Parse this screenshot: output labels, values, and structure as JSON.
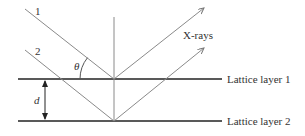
{
  "diagram": {
    "ray_labels": [
      "1",
      "2"
    ],
    "angle_label": "θ",
    "xray_label": "X-rays",
    "spacing_label": "d",
    "layer_labels": [
      "Lattice layer 1",
      "Lattice layer 2"
    ],
    "colors": {
      "ray": "#8a8a8a",
      "layer": "#222222",
      "text": "#333333"
    }
  }
}
